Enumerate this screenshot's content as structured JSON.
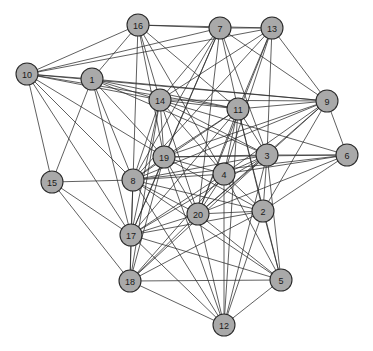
{
  "figure": {
    "type": "network-graph",
    "width": 373,
    "height": 351,
    "background_color": "#ffffff",
    "node_fill": "#a9a9a9",
    "node_stroke": "#2b2b2b",
    "edge_color": "#2b2b2b",
    "node_radius": 11,
    "label_color": "#1a1a1a"
  },
  "chart_data": {
    "type": "graph",
    "title": "",
    "node_count": 20,
    "edge_count": 118,
    "nodes": [
      {
        "id": "1",
        "label": "1",
        "x": 92,
        "y": 79
      },
      {
        "id": "2",
        "label": "2",
        "x": 263,
        "y": 211
      },
      {
        "id": "3",
        "label": "3",
        "x": 267,
        "y": 155
      },
      {
        "id": "4",
        "label": "4",
        "x": 224,
        "y": 174
      },
      {
        "id": "5",
        "label": "5",
        "x": 281,
        "y": 280
      },
      {
        "id": "6",
        "label": "6",
        "x": 347,
        "y": 155
      },
      {
        "id": "7",
        "label": "7",
        "x": 220,
        "y": 28
      },
      {
        "id": "8",
        "label": "8",
        "x": 133,
        "y": 180
      },
      {
        "id": "9",
        "label": "9",
        "x": 327,
        "y": 101
      },
      {
        "id": "10",
        "label": "10",
        "x": 27,
        "y": 74
      },
      {
        "id": "11",
        "label": "11",
        "x": 238,
        "y": 109
      },
      {
        "id": "12",
        "label": "12",
        "x": 224,
        "y": 325
      },
      {
        "id": "13",
        "label": "13",
        "x": 272,
        "y": 28
      },
      {
        "id": "14",
        "label": "14",
        "x": 160,
        "y": 100
      },
      {
        "id": "15",
        "label": "15",
        "x": 52,
        "y": 182
      },
      {
        "id": "16",
        "label": "16",
        "x": 138,
        "y": 25
      },
      {
        "id": "17",
        "label": "17",
        "x": 131,
        "y": 235
      },
      {
        "id": "18",
        "label": "18",
        "x": 130,
        "y": 281
      },
      {
        "id": "19",
        "label": "19",
        "x": 164,
        "y": 157
      },
      {
        "id": "20",
        "label": "20",
        "x": 198,
        "y": 214
      }
    ],
    "edges": [
      [
        "16",
        "7"
      ],
      [
        "16",
        "13"
      ],
      [
        "16",
        "1"
      ],
      [
        "16",
        "8"
      ],
      [
        "16",
        "14"
      ],
      [
        "16",
        "11"
      ],
      [
        "16",
        "19"
      ],
      [
        "16",
        "10"
      ],
      [
        "16",
        "4"
      ],
      [
        "7",
        "13"
      ],
      [
        "7",
        "10"
      ],
      [
        "7",
        "11"
      ],
      [
        "7",
        "14"
      ],
      [
        "7",
        "8"
      ],
      [
        "7",
        "19"
      ],
      [
        "7",
        "3"
      ],
      [
        "7",
        "9"
      ],
      [
        "7",
        "20"
      ],
      [
        "7",
        "17"
      ],
      [
        "13",
        "11"
      ],
      [
        "13",
        "9"
      ],
      [
        "13",
        "3"
      ],
      [
        "13",
        "14"
      ],
      [
        "13",
        "10"
      ],
      [
        "13",
        "4"
      ],
      [
        "13",
        "20"
      ],
      [
        "13",
        "8"
      ],
      [
        "10",
        "1"
      ],
      [
        "10",
        "15"
      ],
      [
        "10",
        "14"
      ],
      [
        "10",
        "11"
      ],
      [
        "10",
        "8"
      ],
      [
        "10",
        "19"
      ],
      [
        "10",
        "17"
      ],
      [
        "10",
        "9"
      ],
      [
        "1",
        "14"
      ],
      [
        "1",
        "8"
      ],
      [
        "1",
        "19"
      ],
      [
        "1",
        "17"
      ],
      [
        "1",
        "11"
      ],
      [
        "1",
        "15"
      ],
      [
        "1",
        "9"
      ],
      [
        "1",
        "3"
      ],
      [
        "14",
        "11"
      ],
      [
        "14",
        "19"
      ],
      [
        "14",
        "8"
      ],
      [
        "14",
        "17"
      ],
      [
        "14",
        "9"
      ],
      [
        "14",
        "3"
      ],
      [
        "14",
        "20"
      ],
      [
        "14",
        "4"
      ],
      [
        "14",
        "18"
      ],
      [
        "14",
        "6"
      ],
      [
        "11",
        "9"
      ],
      [
        "11",
        "3"
      ],
      [
        "11",
        "4"
      ],
      [
        "11",
        "20"
      ],
      [
        "11",
        "19"
      ],
      [
        "11",
        "8"
      ],
      [
        "11",
        "2"
      ],
      [
        "11",
        "17"
      ],
      [
        "11",
        "12"
      ],
      [
        "11",
        "5"
      ],
      [
        "9",
        "3"
      ],
      [
        "9",
        "6"
      ],
      [
        "9",
        "4"
      ],
      [
        "9",
        "2"
      ],
      [
        "9",
        "20"
      ],
      [
        "9",
        "19"
      ],
      [
        "9",
        "8"
      ],
      [
        "6",
        "3"
      ],
      [
        "6",
        "2"
      ],
      [
        "6",
        "4"
      ],
      [
        "6",
        "20"
      ],
      [
        "6",
        "8"
      ],
      [
        "6",
        "19"
      ],
      [
        "3",
        "4"
      ],
      [
        "3",
        "2"
      ],
      [
        "3",
        "20"
      ],
      [
        "3",
        "19"
      ],
      [
        "3",
        "8"
      ],
      [
        "3",
        "17"
      ],
      [
        "3",
        "5"
      ],
      [
        "3",
        "12"
      ],
      [
        "3",
        "18"
      ],
      [
        "19",
        "8"
      ],
      [
        "19",
        "4"
      ],
      [
        "19",
        "20"
      ],
      [
        "19",
        "17"
      ],
      [
        "19",
        "18"
      ],
      [
        "19",
        "2"
      ],
      [
        "19",
        "12"
      ],
      [
        "8",
        "17"
      ],
      [
        "8",
        "18"
      ],
      [
        "8",
        "20"
      ],
      [
        "8",
        "4"
      ],
      [
        "8",
        "2"
      ],
      [
        "8",
        "15"
      ],
      [
        "8",
        "5"
      ],
      [
        "8",
        "12"
      ],
      [
        "4",
        "20"
      ],
      [
        "4",
        "2"
      ],
      [
        "4",
        "17"
      ],
      [
        "4",
        "18"
      ],
      [
        "4",
        "12"
      ],
      [
        "4",
        "5"
      ],
      [
        "20",
        "2"
      ],
      [
        "20",
        "17"
      ],
      [
        "20",
        "18"
      ],
      [
        "20",
        "12"
      ],
      [
        "20",
        "5"
      ],
      [
        "2",
        "5"
      ],
      [
        "2",
        "12"
      ],
      [
        "2",
        "17"
      ],
      [
        "2",
        "18"
      ],
      [
        "17",
        "18"
      ],
      [
        "17",
        "15"
      ],
      [
        "17",
        "12"
      ],
      [
        "17",
        "5"
      ],
      [
        "18",
        "12"
      ],
      [
        "18",
        "5"
      ],
      [
        "18",
        "15"
      ],
      [
        "5",
        "12"
      ]
    ]
  }
}
